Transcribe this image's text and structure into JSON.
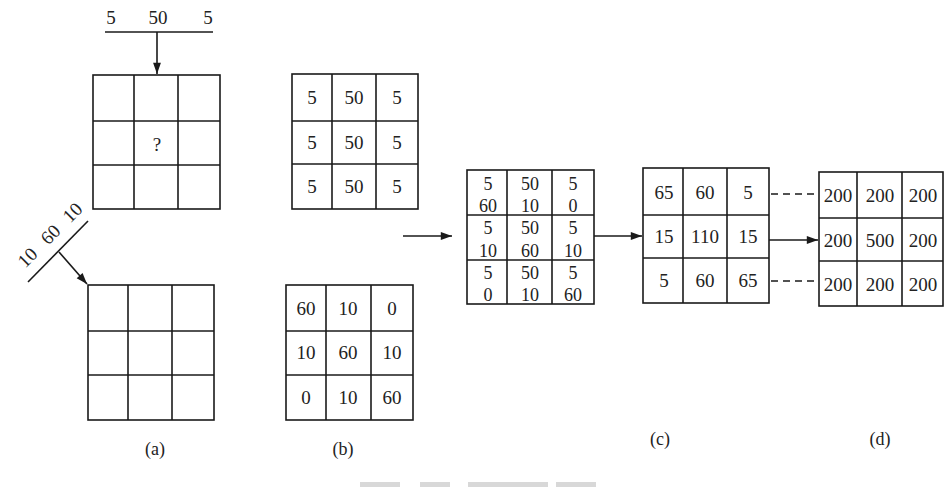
{
  "figure": {
    "panel_a": {
      "label": "(a)",
      "top_kernel_labels": [
        "5",
        "50",
        "5"
      ],
      "top_grid_center_mark": "?",
      "diagonal_kernel_labels": [
        "10",
        "60",
        "10"
      ]
    },
    "panel_b": {
      "label": "(b)",
      "top_grid": [
        [
          "5",
          "50",
          "5"
        ],
        [
          "5",
          "50",
          "5"
        ],
        [
          "5",
          "50",
          "5"
        ]
      ],
      "bottom_grid": [
        [
          "60",
          "10",
          "0"
        ],
        [
          "10",
          "60",
          "10"
        ],
        [
          "0",
          "10",
          "60"
        ]
      ]
    },
    "panel_c": {
      "label": "(c)",
      "stacked_grid": [
        [
          [
            "5",
            "60"
          ],
          [
            "50",
            "10"
          ],
          [
            "5",
            "0"
          ]
        ],
        [
          [
            "5",
            "10"
          ],
          [
            "50",
            "60"
          ],
          [
            "5",
            "10"
          ]
        ],
        [
          [
            "5",
            "0"
          ],
          [
            "50",
            "10"
          ],
          [
            "5",
            "60"
          ]
        ]
      ],
      "sum_grid": [
        [
          "65",
          "60",
          "5"
        ],
        [
          "15",
          "110",
          "15"
        ],
        [
          "5",
          "60",
          "65"
        ]
      ]
    },
    "panel_d": {
      "label": "(d)",
      "grid": [
        [
          "200",
          "200",
          "200"
        ],
        [
          "200",
          "500",
          "200"
        ],
        [
          "200",
          "200",
          "200"
        ]
      ]
    },
    "caption": ""
  },
  "colors": {
    "line": "#1a1a1a",
    "text": "#222222",
    "background": "#ffffff"
  }
}
